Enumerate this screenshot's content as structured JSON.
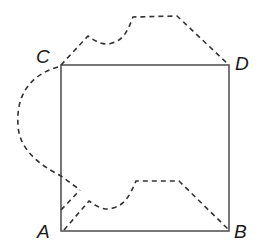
{
  "diagram": {
    "type": "geometry-figure",
    "vertices": {
      "A": {
        "label": "A",
        "x": 61,
        "y": 231
      },
      "B": {
        "label": "B",
        "x": 229,
        "y": 231
      },
      "C": {
        "label": "C",
        "x": 61,
        "y": 65
      },
      "D": {
        "label": "D",
        "x": 229,
        "y": 65
      }
    },
    "colors": {
      "stroke": "#555555",
      "dashed": "#333333",
      "label": "#1a1a1a",
      "background": "#ffffff"
    }
  }
}
